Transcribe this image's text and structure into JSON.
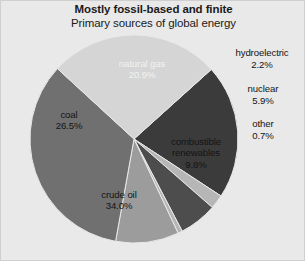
{
  "chart_data": {
    "type": "pie",
    "title": "Mostly fossil-based and finite",
    "subtitle": "Primary sources of global energy",
    "xlabel": "",
    "ylabel": "",
    "legend": "none",
    "grid": false,
    "units": "percent",
    "total": 100.0,
    "categories": [
      "natural gas",
      "hydroelectric",
      "nuclear",
      "other",
      "combustible renewables",
      "crude oil",
      "coal"
    ],
    "values": [
      20.9,
      2.2,
      5.9,
      0.7,
      9.8,
      34.0,
      26.5
    ],
    "value_labels": [
      "20.9%",
      "2.2%",
      "5.9%",
      "0.7%",
      "9.8%",
      "34.0%",
      "26.5%"
    ],
    "colors": [
      "#3b3b3b",
      "#b6b6b6",
      "#4d4d4d",
      "#b6b6b6",
      "#9c9c9c",
      "#707070",
      "#d5d5d5"
    ],
    "slices": [
      {
        "name": "natural gas",
        "value": 20.9,
        "value_label": "20.9%",
        "color": "#3b3b3b",
        "label_placement": "inside",
        "label_text_color": "light"
      },
      {
        "name": "hydroelectric",
        "value": 2.2,
        "value_label": "2.2%",
        "color": "#b6b6b6",
        "label_placement": "outside",
        "label_text_color": "dark"
      },
      {
        "name": "nuclear",
        "value": 5.9,
        "value_label": "5.9%",
        "color": "#4d4d4d",
        "label_placement": "outside",
        "label_text_color": "dark"
      },
      {
        "name": "other",
        "value": 0.7,
        "value_label": "0.7%",
        "color": "#b6b6b6",
        "label_placement": "outside",
        "label_text_color": "dark"
      },
      {
        "name": "combustible renewables",
        "value": 9.8,
        "value_label": "9.8%",
        "color": "#9c9c9c",
        "label_placement": "inside",
        "label_text_color": "dark"
      },
      {
        "name": "crude oil",
        "value": 34.0,
        "value_label": "34.0%",
        "color": "#707070",
        "label_placement": "inside",
        "label_text_color": "dark"
      },
      {
        "name": "coal",
        "value": 26.5,
        "value_label": "26.5%",
        "color": "#d5d5d5",
        "label_placement": "inside",
        "label_text_color": "dark"
      }
    ],
    "geometry": {
      "center_x": 133,
      "center_y": 138,
      "radius": 104,
      "start_angle_deg": -42,
      "direction": "clockwise"
    },
    "background_color": "#e9e9e9"
  },
  "labels": {
    "natural_gas": {
      "name": "natural gas",
      "value": "20.9%"
    },
    "coal": {
      "name": "coal",
      "value": "26.5%"
    },
    "crude_oil": {
      "name": "crude oil",
      "value": "34.0%"
    },
    "combustible_renewables": {
      "name_line1": "combustible",
      "name_line2": "renewables",
      "value": "9.8%"
    },
    "hydroelectric": {
      "name": "hydroelectric",
      "value": "2.2%"
    },
    "nuclear": {
      "name": "nuclear",
      "value": "5.9%"
    },
    "other": {
      "name": "other",
      "value": "0.7%"
    }
  }
}
